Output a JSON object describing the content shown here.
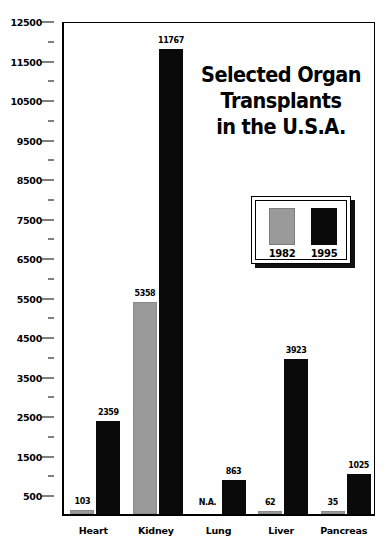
{
  "chart_data": {
    "type": "bar",
    "title_lines": [
      "Selected Organ",
      "Transplants",
      "in the U.S.A."
    ],
    "xlabel": "",
    "ylabel": "",
    "ylim": [
      0,
      12500
    ],
    "y_major_step": 1000,
    "y_minor_step": 500,
    "grid": false,
    "legend_position": "upper-right-inset",
    "categories": [
      "Heart",
      "Kidney",
      "Lung",
      "Liver",
      "Pancreas"
    ],
    "series": [
      {
        "name": "1982",
        "color": "#9a9a9a",
        "values": [
          103,
          5358,
          null,
          62,
          35
        ],
        "labels": [
          "103",
          "5358",
          "N.A.",
          "62",
          "35"
        ]
      },
      {
        "name": "1995",
        "color": "#0a0a0a",
        "values": [
          2359,
          11767,
          863,
          3923,
          1025
        ],
        "labels": [
          "2359",
          "11767",
          "863",
          "3923",
          "1025"
        ]
      }
    ],
    "y_tick_labels": [
      "12500",
      "11500",
      "10500",
      "9500",
      "8500",
      "7500",
      "6500",
      "5500",
      "4500",
      "3500",
      "2500",
      "1500",
      "500"
    ],
    "y_tick_values": [
      12500,
      11500,
      10500,
      9500,
      8500,
      7500,
      6500,
      5500,
      4500,
      3500,
      2500,
      1500,
      500
    ]
  },
  "legend": {
    "entries": [
      {
        "label": "1982",
        "swatch": "gray"
      },
      {
        "label": "1995",
        "swatch": "black"
      }
    ]
  },
  "colors": {
    "series_1982": "#9a9a9a",
    "series_1995": "#0a0a0a",
    "axis": "#000000",
    "background": "#ffffff"
  }
}
